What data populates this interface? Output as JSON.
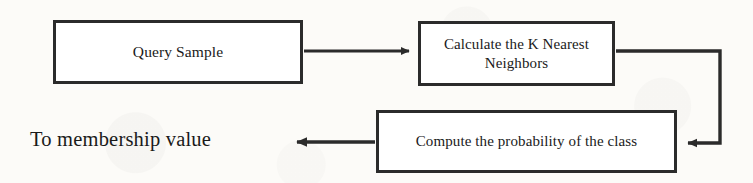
{
  "diagram": {
    "background_color": "#fcfbf8",
    "stroke_color": "#2b2b2b",
    "text_color": "#1a1a1a",
    "nodes": [
      {
        "id": "query-sample",
        "label": "Query Sample",
        "shape": "rectangle"
      },
      {
        "id": "calculate-knn",
        "label": "Calculate the K Nearest Neighbors",
        "shape": "rectangle"
      },
      {
        "id": "compute-probability",
        "label": "Compute the probability of the class",
        "shape": "rectangle"
      }
    ],
    "terminal_text": "To membership value",
    "edges": [
      {
        "id": "query-to-calculate",
        "from": "query-sample",
        "to": "calculate-knn",
        "direction": "right",
        "label": ""
      },
      {
        "id": "calculate-to-compute",
        "from": "calculate-knn",
        "to": "compute-probability",
        "direction": "right-down-left",
        "label": ""
      },
      {
        "id": "compute-to-membership",
        "from": "compute-probability",
        "to": "terminal-membership-value",
        "direction": "left",
        "label": ""
      }
    ]
  }
}
